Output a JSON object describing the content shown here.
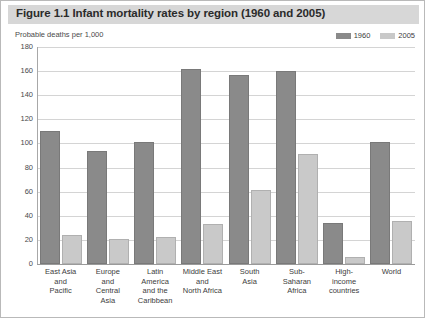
{
  "figure": {
    "title": "Figure 1.1 Infant mortality rates by region (1960 and 2005)",
    "subtitle": "Probable deaths per 1,000"
  },
  "colors": {
    "series_1960": "#8a8a8a",
    "series_2005": "#c9c9c9",
    "title_band": "#d7d7d7",
    "gridline": "#d4d4d4",
    "frame": "#b9b9b9"
  },
  "legend": {
    "position": "top-right",
    "entries": [
      {
        "label": "1960",
        "color": "#8a8a8a"
      },
      {
        "label": "2005",
        "color": "#c9c9c9"
      }
    ]
  },
  "chart_data": {
    "type": "bar",
    "title": "Figure 1.1 Infant mortality rates by region (1960 and 2005)",
    "subtitle": "Probable deaths per 1,000",
    "xlabel": "",
    "ylabel": "Probable deaths per 1,000",
    "ylim": [
      0,
      180
    ],
    "ytick_labels": [
      "180",
      "160",
      "140",
      "120",
      "100",
      "80",
      "60",
      "40",
      "20",
      "0"
    ],
    "yticks": [
      180,
      160,
      140,
      120,
      100,
      80,
      60,
      40,
      20,
      0
    ],
    "grid": true,
    "legend_position": "top-right",
    "categories": [
      "East Asia and Pacific",
      "Europe and Central Asia",
      "Latin America and the Caribbean",
      "Middle East and North Africa",
      "South Asia",
      "Sub-Saharan Africa",
      "High-income countries",
      "World"
    ],
    "category_lines": [
      [
        "East Asia",
        "and",
        "Pacific"
      ],
      [
        "Europe",
        "and",
        "Central",
        "Asia"
      ],
      [
        "Latin",
        "America",
        "and the",
        "Caribbean"
      ],
      [
        "Middle East",
        "and",
        "North Africa"
      ],
      [
        "South",
        "Asia"
      ],
      [
        "Sub-",
        "Saharan",
        "Africa"
      ],
      [
        "High-",
        "income",
        "countries"
      ],
      [
        "World"
      ]
    ],
    "series": [
      {
        "name": "1960",
        "color": "#8a8a8a",
        "values": [
          110,
          94,
          101,
          162,
          157,
          160,
          34,
          101
        ]
      },
      {
        "name": "2005",
        "color": "#c9c9c9",
        "values": [
          24,
          21,
          22,
          33,
          61,
          91,
          6,
          36
        ]
      }
    ]
  }
}
